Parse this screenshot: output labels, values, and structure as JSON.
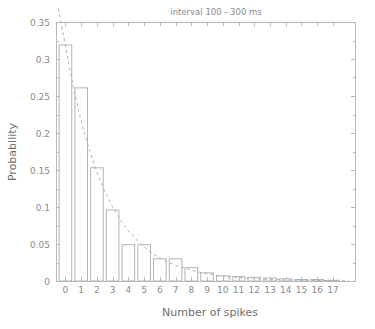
{
  "chart_data": {
    "type": "bar",
    "title": "interval   100 - 300 ms",
    "xlabel": "Number of spikes",
    "ylabel": "Probability",
    "categories": [
      0,
      1,
      2,
      3,
      4,
      5,
      6,
      7,
      8,
      9,
      10,
      11,
      12,
      13,
      14,
      15,
      16,
      17
    ],
    "values": [
      0.319,
      0.261,
      0.153,
      0.096,
      0.049,
      0.049,
      0.03,
      0.03,
      0.018,
      0.011,
      0.007,
      0.006,
      0.005,
      0.004,
      0.003,
      0.002,
      0.002,
      0.001
    ],
    "xlim": [
      -0.6,
      18.4
    ],
    "ylim": [
      0,
      0.35
    ],
    "xticks": [
      "0",
      "1",
      "2",
      "3",
      "4",
      "5",
      "6",
      "7",
      "8",
      "9",
      "10",
      "11",
      "12",
      "13",
      "14",
      "15",
      "16",
      "17"
    ],
    "yticks": [
      "0",
      "0.05",
      "0.1",
      "0.15",
      "0.2",
      "0.25",
      "0.3",
      "0.35"
    ],
    "ytick_values": [
      0,
      0.05,
      0.1,
      0.15,
      0.2,
      0.25,
      0.3,
      0.35
    ],
    "grid": false,
    "legend": null,
    "series": [
      {
        "name": "histogram",
        "style": "bar-outline",
        "color": "#b4b4b4",
        "values": [
          0.319,
          0.261,
          0.153,
          0.096,
          0.049,
          0.049,
          0.03,
          0.03,
          0.018,
          0.011,
          0.007,
          0.006,
          0.005,
          0.004,
          0.003,
          0.002,
          0.002,
          0.001
        ]
      },
      {
        "name": "exponential-fit",
        "style": "dashed-line",
        "color": "#b0b0b0",
        "x": [
          -0.45,
          0,
          0.5,
          1,
          1.5,
          2,
          2.5,
          3,
          3.5,
          4,
          4.5,
          5,
          5.5,
          6,
          6.5,
          7,
          7.5,
          8,
          8.5,
          9,
          9.5,
          10,
          11,
          12,
          13,
          14,
          15,
          16,
          17,
          18
        ],
        "values": [
          0.368,
          0.318,
          0.262,
          0.216,
          0.178,
          0.147,
          0.121,
          0.1,
          0.082,
          0.068,
          0.056,
          0.046,
          0.038,
          0.031,
          0.026,
          0.021,
          0.018,
          0.0145,
          0.012,
          0.0099,
          0.0082,
          0.0067,
          0.0046,
          0.0031,
          0.0021,
          0.0014,
          0.001,
          0.0007,
          0.0005,
          0.0003
        ]
      }
    ]
  },
  "plot_geometry": {
    "left": 56,
    "right": 355,
    "top": 22,
    "bottom": 281
  },
  "colors": {
    "axis": "#b9b9b9",
    "bar_stroke": "#b4b4b4",
    "fit_line": "#b0b0b0",
    "text": "#8a8a8a",
    "axis_title": "#6f6f6f",
    "background": "#ffffff"
  }
}
